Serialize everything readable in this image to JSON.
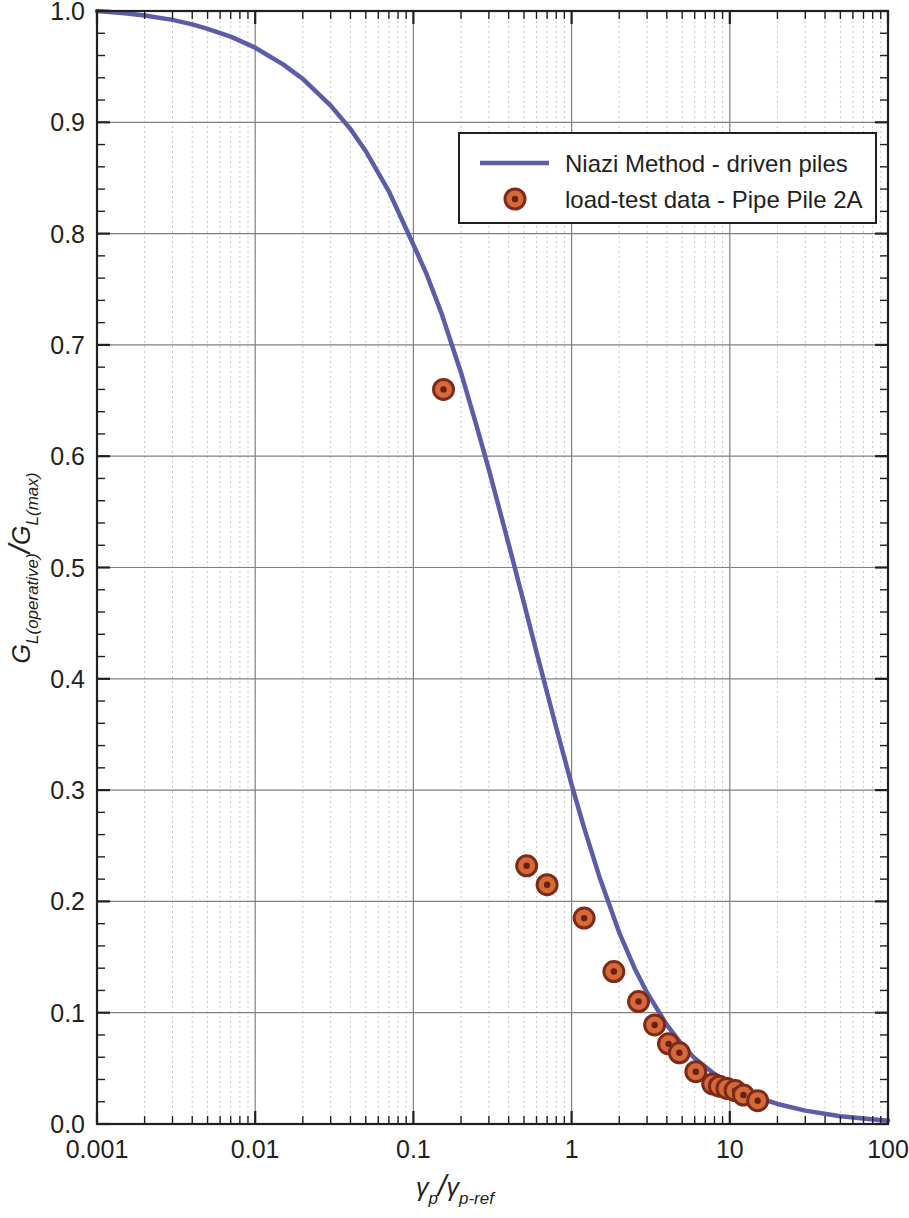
{
  "chart_data": {
    "type": "line",
    "title": "",
    "xlabel": "γp/γp-ref",
    "ylabel": "GL(operative)/GL(max)",
    "xscale": "log",
    "yscale": "linear",
    "xlim": [
      0.001,
      100
    ],
    "ylim": [
      0.0,
      1.0
    ],
    "grid": true,
    "legend_position": "upper right",
    "xticks": [
      "0.001",
      "0.01",
      "0.1",
      "1",
      "10",
      "100"
    ],
    "xtick_values": [
      0.001,
      0.01,
      0.1,
      1,
      10,
      100
    ],
    "yticks": [
      "0.0",
      "0.1",
      "0.2",
      "0.3",
      "0.4",
      "0.5",
      "0.6",
      "0.7",
      "0.8",
      "0.9",
      "1.0"
    ],
    "ytick_values": [
      0.0,
      0.1,
      0.2,
      0.3,
      0.4,
      0.5,
      0.6,
      0.7,
      0.8,
      0.9,
      1.0
    ],
    "series": [
      {
        "name": "Niazi Method - driven piles",
        "type": "line",
        "color": "#5b5ea6",
        "x": [
          0.001,
          0.0015,
          0.002,
          0.003,
          0.004,
          0.005,
          0.007,
          0.01,
          0.015,
          0.02,
          0.03,
          0.04,
          0.05,
          0.07,
          0.1,
          0.12,
          0.15,
          0.2,
          0.25,
          0.3,
          0.4,
          0.5,
          0.6,
          0.8,
          1.0,
          1.2,
          1.5,
          2.0,
          2.5,
          3.0,
          4.0,
          5.0,
          6.0,
          8.0,
          10.0,
          15.0,
          20.0,
          30.0,
          50.0,
          70.0,
          100.0
        ],
        "y": [
          1.0,
          0.998,
          0.996,
          0.992,
          0.988,
          0.984,
          0.977,
          0.967,
          0.952,
          0.939,
          0.915,
          0.894,
          0.874,
          0.838,
          0.79,
          0.765,
          0.729,
          0.675,
          0.628,
          0.588,
          0.521,
          0.468,
          0.424,
          0.356,
          0.305,
          0.266,
          0.222,
          0.172,
          0.14,
          0.118,
          0.089,
          0.071,
          0.059,
          0.045,
          0.036,
          0.024,
          0.018,
          0.012,
          0.007,
          0.005,
          0.003
        ]
      },
      {
        "name": "load-test data - Pipe Pile 2A",
        "type": "scatter",
        "marker_fill": "#d4693a",
        "marker_edge": "#7e2a18",
        "marker_core": "#6a1f10",
        "x": [
          0.155,
          0.52,
          0.7,
          1.2,
          1.85,
          2.65,
          3.35,
          4.1,
          4.8,
          6.1,
          7.8,
          8.6,
          9.6,
          10.8,
          12.2,
          15.0
        ],
        "y": [
          0.66,
          0.232,
          0.215,
          0.185,
          0.137,
          0.11,
          0.089,
          0.072,
          0.064,
          0.047,
          0.036,
          0.034,
          0.032,
          0.03,
          0.026,
          0.021
        ]
      }
    ]
  },
  "legend": {
    "entries": [
      {
        "label": "Niazi Method - driven piles",
        "marker": "line"
      },
      {
        "label": "load-test data - Pipe Pile 2A",
        "marker": "circle"
      }
    ]
  },
  "axes": {
    "x_title": "γp/γp-ref",
    "x_title_parts": {
      "num": "γ",
      "num_sub": "p",
      "den": "γ",
      "den_sub": "p-ref"
    },
    "y_title": "GL(operative)/GL(max)",
    "y_title_parts": {
      "num": "G",
      "num_sub": "L(operative)",
      "den": "G",
      "den_sub": "L(max)"
    }
  },
  "colors": {
    "curve": "#5b5ea6",
    "marker_fill": "#d4693a",
    "marker_edge": "#7e2a18",
    "grid_major": "#808080",
    "grid_minor": "#c8c8c8",
    "axis": "#231f20",
    "text": "#231f20"
  }
}
